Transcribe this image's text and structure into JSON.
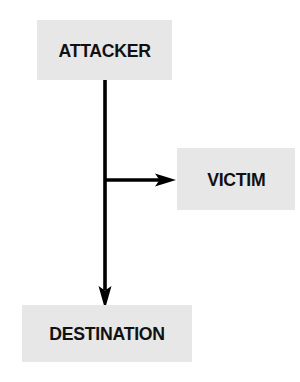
{
  "diagram": {
    "canvas": {
      "width": 300,
      "height": 382,
      "background": "#ffffff"
    },
    "style": {
      "node_fill": "#e7e7e7",
      "node_text_color": "#111111",
      "connector_color": "#000000"
    },
    "nodes": [
      {
        "id": "attacker",
        "label": "ATTACKER",
        "x": 37,
        "y": 20,
        "width": 135,
        "height": 60
      },
      {
        "id": "victim",
        "label": "VICTIM",
        "x": 177,
        "y": 148,
        "width": 118,
        "height": 62
      },
      {
        "id": "destination",
        "label": "DESTINATION",
        "x": 22,
        "y": 305,
        "width": 170,
        "height": 57
      }
    ],
    "connectors": [
      {
        "id": "attacker-to-destination",
        "from": "attacker",
        "to": "destination",
        "orientation": "vertical",
        "arrowhead": "down",
        "label": ""
      },
      {
        "id": "attacker-to-victim",
        "from": "attacker",
        "to": "victim",
        "orientation": "horizontal",
        "arrowhead": "right",
        "label": ""
      }
    ]
  }
}
